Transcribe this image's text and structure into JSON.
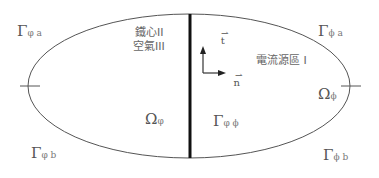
{
  "diagram": {
    "regions": {
      "left_label_line1": "鐵心II",
      "left_label_line2": "空氣III",
      "right_label": "電流源區 I"
    },
    "boundaries": {
      "top_left": {
        "symbol": "Γ",
        "sub": "φ a"
      },
      "top_right": {
        "symbol": "Γ",
        "sub": "ϕ a"
      },
      "bottom_left": {
        "symbol": "Γ",
        "sub": "φ b"
      },
      "bottom_right": {
        "symbol": "Γ",
        "sub": "ϕ b"
      },
      "interface": {
        "symbol": "Γ",
        "sub": "φ ϕ"
      }
    },
    "domains": {
      "left": {
        "symbol": "Ω",
        "sub": "φ"
      },
      "right": {
        "symbol": "Ω",
        "sub": "ϕ"
      }
    },
    "vectors": {
      "tangent": "t",
      "normal": "n",
      "arrow_glyph": "⇀"
    },
    "colors": {
      "outline": "#555555",
      "interface_line": "#111111",
      "text": "#555555"
    }
  }
}
